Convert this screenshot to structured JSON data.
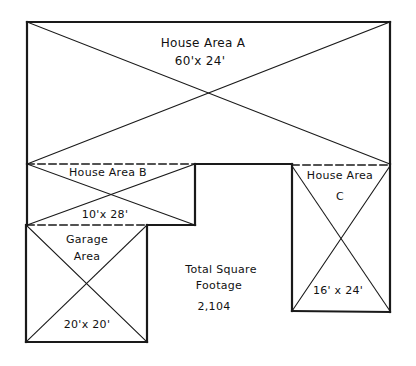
{
  "diagram": {
    "type": "floor-plan-area-breakdown",
    "stroke_color": "#1a1a1a",
    "background": "#ffffff",
    "areas": [
      {
        "id": "house_a",
        "name": "House Area A",
        "dimensions": "60'x 24'",
        "width_ft": 60,
        "depth_ft": 24,
        "sq_ft": 1440
      },
      {
        "id": "house_b",
        "name": "House Area B",
        "dimensions": "10'x 28'",
        "width_ft": 10,
        "depth_ft": 28,
        "sq_ft": 280
      },
      {
        "id": "garage",
        "name_line1": "Garage",
        "name_line2": "Area",
        "dimensions": "20'x 20'",
        "width_ft": 20,
        "depth_ft": 20,
        "sq_ft": 400
      },
      {
        "id": "house_c",
        "name_line1": "House Area",
        "name_line2": "C",
        "dimensions": "16' x 24'",
        "width_ft": 16,
        "depth_ft": 24,
        "sq_ft": 384
      }
    ],
    "total": {
      "line1": "Total Square",
      "line2": "Footage",
      "value": "2,104"
    }
  }
}
